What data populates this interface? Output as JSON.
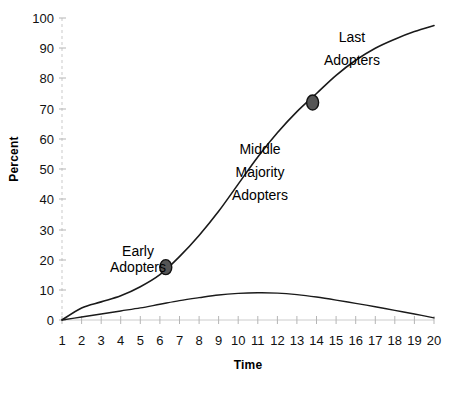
{
  "chart_data": {
    "type": "line",
    "title": "",
    "xlabel": "Time",
    "ylabel": "Percent",
    "xlim": [
      1,
      20
    ],
    "ylim": [
      0,
      100
    ],
    "grid": false,
    "legend": "none",
    "xticks": [
      "1",
      "2",
      "3",
      "4",
      "5",
      "6",
      "7",
      "8",
      "9",
      "10",
      "11",
      "12",
      "13",
      "14",
      "15",
      "16",
      "17",
      "18",
      "19",
      "20"
    ],
    "yticks": [
      "0",
      "10",
      "20",
      "30",
      "40",
      "50",
      "60",
      "70",
      "80",
      "90",
      "100"
    ],
    "series": [
      {
        "name": "Cumulative Adoption",
        "type": "line",
        "x": [
          1,
          2,
          3,
          4,
          5,
          6,
          7,
          8,
          9,
          10,
          11,
          12,
          13,
          14,
          15,
          16,
          17,
          18,
          19,
          20
        ],
        "values": [
          0,
          4,
          6,
          8,
          11,
          15,
          21,
          28,
          36,
          45,
          54,
          62,
          69,
          75,
          81,
          86,
          90,
          93,
          95.5,
          97.5
        ]
      },
      {
        "name": "Adoption Rate",
        "type": "line",
        "x": [
          1,
          2,
          3,
          4,
          5,
          6,
          7,
          8,
          9,
          10,
          11,
          12,
          13,
          14,
          15,
          16,
          17,
          18,
          19,
          20
        ],
        "values": [
          0,
          1,
          2,
          3,
          4,
          5.2,
          6.4,
          7.4,
          8.3,
          8.8,
          9,
          8.9,
          8.4,
          7.6,
          6.6,
          5.5,
          4.4,
          3.2,
          2,
          0.7
        ]
      }
    ],
    "markers": [
      {
        "label": "early-adopters-marker",
        "x": 6.3,
        "y": 17.5
      },
      {
        "label": "last-adopters-marker",
        "x": 13.8,
        "y": 72
      }
    ],
    "annotations": [
      {
        "name": "early-adopters",
        "lines": [
          "Early",
          "Adopters"
        ],
        "x": 138,
        "y": 243
      },
      {
        "name": "middle-majority-adopters",
        "lines": [
          "Middle",
          "Majority",
          "Adopters"
        ],
        "x": 260,
        "y": 138
      },
      {
        "name": "last-adopters",
        "lines": [
          "Last",
          "Adopters"
        ],
        "x": 352,
        "y": 26
      }
    ]
  }
}
